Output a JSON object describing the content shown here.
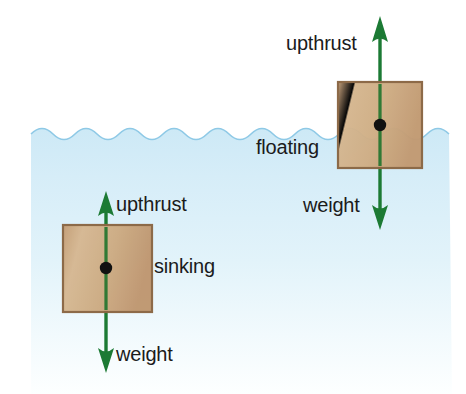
{
  "diagram": {
    "canvas": {
      "width": 466,
      "height": 394,
      "background": "#ffffff"
    },
    "water": {
      "name": "water",
      "surface_y": 124,
      "left_x": 31,
      "right_x": 452,
      "bottom_y": 394,
      "color_top": "#d4ecf7",
      "color_bottom": "#ffffff",
      "wave_edge": true
    },
    "colors": {
      "arrow_green": "#1c7a34",
      "block_fill": "#c9a67e",
      "block_fill_light": "#d8bb96",
      "block_border": "#8a6643",
      "center_dot": "#111111",
      "text": "#1b1b1b",
      "water_top": "#d4ecf7",
      "water_bottom": "#ffffff",
      "background": "#ffffff"
    },
    "objects": [
      {
        "id": "floating-block",
        "state_label": "floating",
        "block": {
          "x": 338,
          "y": 82,
          "width": 84,
          "height": 86
        },
        "center_dot": {
          "cx": 380,
          "cy": 125,
          "r": 6
        },
        "forces": [
          {
            "id": "upthrust-floating",
            "label": "upthrust",
            "direction": "up",
            "from_y": 168,
            "to_y": 18,
            "x": 380
          },
          {
            "id": "weight-floating",
            "label": "weight",
            "direction": "down",
            "from_y": 82,
            "to_y": 228,
            "x": 380
          }
        ]
      },
      {
        "id": "sinking-block",
        "state_label": "sinking",
        "block": {
          "x": 63,
          "y": 225,
          "width": 89,
          "height": 87
        },
        "center_dot": {
          "cx": 106,
          "cy": 268,
          "r": 6
        },
        "forces": [
          {
            "id": "upthrust-sinking",
            "label": "upthrust",
            "direction": "up",
            "from_y": 312,
            "to_y": 192,
            "x": 106
          },
          {
            "id": "weight-sinking",
            "label": "weight",
            "direction": "down",
            "from_y": 225,
            "to_y": 372,
            "x": 106
          }
        ]
      }
    ],
    "labels": {
      "upthrust_floating": "upthrust",
      "floating": "floating",
      "weight_floating": "weight",
      "upthrust_sinking": "upthrust",
      "sinking": "sinking",
      "weight_sinking": "weight"
    }
  }
}
